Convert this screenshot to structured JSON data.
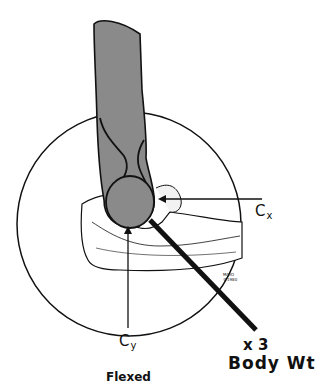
{
  "figure": {
    "caption": "Flexed",
    "labels": {
      "cx_base": "C",
      "cx_sub": "x",
      "cy_base": "C",
      "cy_sub": "y",
      "force_multiplier": "x 3",
      "force_label": "Body Wt"
    },
    "copyright": {
      "line1": "MAYO",
      "line2": "©1980"
    },
    "colors": {
      "bone_shaded": "#8a8a8a",
      "outline": "#111111",
      "background": "#ffffff"
    }
  }
}
